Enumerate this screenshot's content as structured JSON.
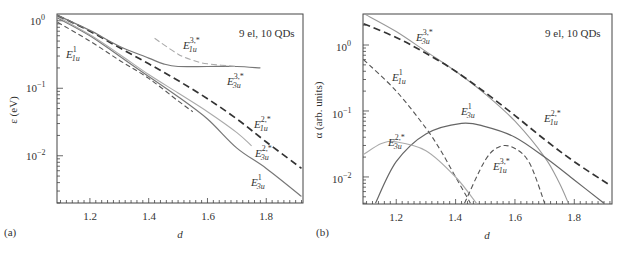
{
  "chart_data": [
    {
      "panel": "(a)",
      "type": "line",
      "title": "",
      "annotation": "9 el, 10 QDs",
      "xlabel": "d",
      "ylabel": "ε (eV)",
      "yscale": "log",
      "xlim": [
        1.09,
        1.92
      ],
      "ylim": [
        0.002,
        1.25
      ],
      "xticks": [
        "1.2",
        "1.4",
        "1.6",
        "1.8"
      ],
      "yticks": [
        "10^0",
        "10^-1",
        "10^-2"
      ],
      "grid": false,
      "series": [
        {
          "name": "E1u^1",
          "style": "dashed-thin",
          "color": "#555555",
          "x": [
            1.09,
            1.2,
            1.3,
            1.4,
            1.5,
            1.55
          ],
          "y": [
            0.95,
            0.5,
            0.26,
            0.14,
            0.065,
            0.045
          ]
        },
        {
          "name": "E3u^1",
          "style": "solid",
          "color": "#777777",
          "x": [
            1.09,
            1.2,
            1.3,
            1.4,
            1.5,
            1.6,
            1.7,
            1.8,
            1.92
          ],
          "y": [
            1.1,
            0.6,
            0.3,
            0.15,
            0.075,
            0.035,
            0.013,
            0.0065,
            0.0025
          ]
        },
        {
          "name": "E3u^2*",
          "style": "solid-light",
          "color": "#aaaaaa",
          "x": [
            1.09,
            1.2,
            1.3,
            1.4,
            1.5,
            1.6,
            1.7,
            1.75
          ],
          "y": [
            1.15,
            0.62,
            0.32,
            0.16,
            0.085,
            0.045,
            0.022,
            0.014
          ]
        },
        {
          "name": "E1u^2*",
          "style": "dashed-thick",
          "color": "#333333",
          "x": [
            1.09,
            1.2,
            1.3,
            1.4,
            1.5,
            1.6,
            1.7,
            1.8,
            1.92
          ],
          "y": [
            1.2,
            0.7,
            0.4,
            0.23,
            0.13,
            0.07,
            0.035,
            0.016,
            0.0065
          ]
        },
        {
          "name": "E3u^3*",
          "style": "solid",
          "color": "#777777",
          "x": [
            1.09,
            1.2,
            1.3,
            1.4,
            1.45,
            1.5,
            1.6,
            1.7,
            1.78
          ],
          "y": [
            1.2,
            0.72,
            0.42,
            0.28,
            0.23,
            0.21,
            0.21,
            0.21,
            0.2
          ]
        },
        {
          "name": "E1u^3*",
          "style": "dashed-light",
          "color": "#aaaaaa",
          "x": [
            1.42,
            1.5,
            1.55,
            1.6,
            1.7
          ],
          "y": [
            0.55,
            0.32,
            0.26,
            0.23,
            0.21
          ]
        }
      ]
    },
    {
      "panel": "(b)",
      "type": "line",
      "title": "",
      "annotation": "9 el, 10 QDs",
      "xlabel": "d",
      "ylabel": "α (arb. units)",
      "yscale": "log",
      "xlim": [
        1.09,
        1.92
      ],
      "ylim": [
        0.004,
        3.2
      ],
      "xticks": [
        "1.2",
        "1.4",
        "1.6",
        "1.8"
      ],
      "yticks": [
        "10^0",
        "10^-1",
        "10^-2"
      ],
      "grid": false,
      "series": [
        {
          "name": "E3u^3*",
          "style": "solid-light",
          "color": "#999999",
          "x": [
            1.09,
            1.2,
            1.3,
            1.4,
            1.5,
            1.6,
            1.7,
            1.75,
            1.78
          ],
          "y": [
            3.0,
            1.6,
            0.8,
            0.4,
            0.18,
            0.07,
            0.02,
            0.008,
            0.004
          ]
        },
        {
          "name": "E1u^2*",
          "style": "dashed-thick",
          "color": "#333333",
          "x": [
            1.09,
            1.2,
            1.3,
            1.4,
            1.5,
            1.6,
            1.7,
            1.8,
            1.92
          ],
          "y": [
            2.1,
            1.3,
            0.75,
            0.4,
            0.19,
            0.085,
            0.037,
            0.017,
            0.0075
          ]
        },
        {
          "name": "E1u^1",
          "style": "dashed-thin",
          "color": "#555555",
          "x": [
            1.09,
            1.2,
            1.3,
            1.35,
            1.4,
            1.45
          ],
          "y": [
            0.6,
            0.2,
            0.055,
            0.025,
            0.01,
            0.004
          ]
        },
        {
          "name": "E3u^1",
          "style": "solid",
          "color": "#666666",
          "x": [
            1.13,
            1.2,
            1.3,
            1.42,
            1.5,
            1.6,
            1.7,
            1.8,
            1.9
          ],
          "y": [
            0.004,
            0.017,
            0.045,
            0.065,
            0.058,
            0.04,
            0.02,
            0.009,
            0.004
          ]
        },
        {
          "name": "E3u^2*",
          "style": "solid-light",
          "color": "#aaaaaa",
          "x": [
            1.09,
            1.15,
            1.2,
            1.3,
            1.4,
            1.47
          ],
          "y": [
            0.022,
            0.032,
            0.034,
            0.025,
            0.01,
            0.004
          ]
        },
        {
          "name": "E1u^3*",
          "style": "dashed-thin",
          "color": "#555555",
          "x": [
            1.43,
            1.5,
            1.55,
            1.6,
            1.65,
            1.7
          ],
          "y": [
            0.004,
            0.018,
            0.029,
            0.027,
            0.016,
            0.004
          ]
        }
      ]
    }
  ],
  "labels": {
    "a": {
      "panel": "(a)",
      "annot": "9 el, 10 QDs",
      "xlabel": "d",
      "ylabel": "ε (eV)",
      "xticks": [
        "1.2",
        "1.4",
        "1.6",
        "1.8"
      ],
      "ytick_base": "10",
      "ytick_exps": [
        "0",
        "−1",
        "−2"
      ],
      "curves": {
        "E1u1": {
          "base": "E",
          "sub": "1u",
          "sup": "1"
        },
        "E1u3": {
          "base": "E",
          "sub": "1u",
          "sup": "3,*"
        },
        "E3u3": {
          "base": "E",
          "sub": "3u",
          "sup": "3,*"
        },
        "E1u2": {
          "base": "E",
          "sub": "1u",
          "sup": "2,*"
        },
        "E3u2": {
          "base": "E",
          "sub": "3u",
          "sup": "2,*"
        },
        "E3u1": {
          "base": "E",
          "sub": "3u",
          "sup": "1"
        }
      }
    },
    "b": {
      "panel": "(b)",
      "annot": "9 el, 10 QDs",
      "xlabel": "d",
      "ylabel": "α (arb. units)",
      "xticks": [
        "1.2",
        "1.4",
        "1.6",
        "1.8"
      ],
      "ytick_base": "10",
      "ytick_exps": [
        "0",
        "−1",
        "−2"
      ],
      "curves": {
        "E3u3": {
          "base": "E",
          "sub": "3u",
          "sup": "3,*"
        },
        "E1u1": {
          "base": "E",
          "sub": "1u",
          "sup": "1"
        },
        "E3u1": {
          "base": "E",
          "sub": "3u",
          "sup": "1"
        },
        "E1u2": {
          "base": "E",
          "sub": "1u",
          "sup": "2,*"
        },
        "E3u2": {
          "base": "E",
          "sub": "3u",
          "sup": "2,*"
        },
        "E1u3": {
          "base": "E",
          "sub": "1u",
          "sup": "3,*"
        }
      }
    }
  }
}
